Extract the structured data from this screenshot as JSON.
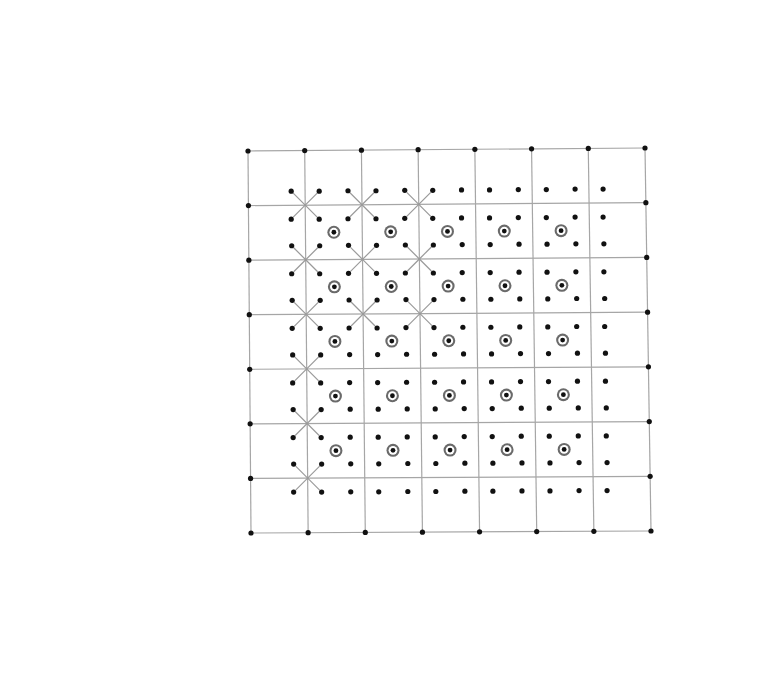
{
  "diagram": {
    "title": "",
    "grid": {
      "cols": 7,
      "rows": 7
    },
    "lattice_dots": "four dots around every interior grid intersection",
    "targets": {
      "description": "bullseye markers at cell centers",
      "cols": [
        1,
        2,
        3,
        4,
        5
      ],
      "rows": [
        1,
        2,
        3,
        4,
        5
      ]
    },
    "star_intersections": [
      [
        1,
        1
      ],
      [
        2,
        1
      ],
      [
        3,
        1
      ],
      [
        1,
        2
      ],
      [
        2,
        2
      ],
      [
        3,
        2
      ],
      [
        1,
        3
      ],
      [
        2,
        3
      ],
      [
        3,
        3
      ],
      [
        1,
        4
      ],
      [
        1,
        5
      ],
      [
        1,
        6
      ]
    ],
    "colors": {
      "grid_line": "#a6a6a6",
      "spoke": "#9a9a9a",
      "dot": "#111111",
      "target_ring": "#6a6a6a"
    }
  }
}
